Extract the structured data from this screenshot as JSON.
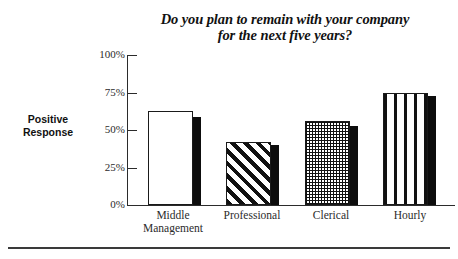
{
  "chart_data": {
    "type": "bar",
    "title": "Do you plan to remain with your company for the next five years?",
    "title_line1": "Do you plan to remain with your company",
    "title_line2": "for the next five years?",
    "xlabel": "",
    "ylabel": "Positive Response",
    "ylabel_line1": "Positive",
    "ylabel_line2": "Response",
    "categories": [
      "Middle Management",
      "Professional",
      "Clerical",
      "Hourly"
    ],
    "category_lines": [
      [
        "Middle",
        "Management"
      ],
      [
        "Professional"
      ],
      [
        "Clerical"
      ],
      [
        "Hourly"
      ]
    ],
    "values": [
      63,
      42,
      56,
      75
    ],
    "ylim": [
      0,
      100
    ],
    "ytick_labels": [
      "100%",
      "75%",
      "50%",
      "25%",
      "0%"
    ],
    "ytick_values": [
      100,
      75,
      50,
      25,
      0
    ],
    "grid": false,
    "legend": "none",
    "series": [
      {
        "name": "Positive Response",
        "values": [
          63,
          42,
          56,
          75
        ],
        "fills": [
          "solid-white",
          "diagonal-hatch",
          "checker",
          "vertical-stripe"
        ]
      }
    ],
    "value_unit": "%",
    "colors": {
      "ink": "#1a1a1a",
      "bar_face": "#ffffff",
      "bar_shadow": "#0d0d0d",
      "axis": "#2b2b2b",
      "background": "#ffffff"
    }
  },
  "bars": [
    {
      "label": "Middle Management",
      "value": 63,
      "shadow_value": 59,
      "fill": "solid-white"
    },
    {
      "label": "Professional",
      "value": 42,
      "shadow_value": 40,
      "fill": "diagonal-hatch"
    },
    {
      "label": "Clerical",
      "value": 56,
      "shadow_value": 53,
      "fill": "checker"
    },
    {
      "label": "Hourly",
      "value": 75,
      "shadow_value": 73,
      "fill": "vertical-stripe"
    }
  ],
  "axis": {
    "ticks": [
      {
        "label": "100%",
        "value": 100
      },
      {
        "label": "75%",
        "value": 75
      },
      {
        "label": "50%",
        "value": 50
      },
      {
        "label": "25%",
        "value": 25
      },
      {
        "label": "0%",
        "value": 0
      }
    ]
  }
}
